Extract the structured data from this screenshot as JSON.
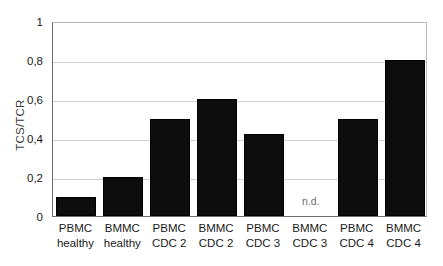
{
  "chart_data": {
    "type": "bar",
    "title": "",
    "subtitle": "",
    "xlabel": "",
    "ylabel": "TCS/TCR",
    "ylim": [
      0,
      1
    ],
    "ytick_labels": [
      "1",
      "0,8",
      "0,6",
      "0,4",
      "0,2",
      "0"
    ],
    "ytick_values": [
      1,
      0.8,
      0.6,
      0.4,
      0.2,
      0
    ],
    "grid": true,
    "legend": false,
    "legend_position": "none",
    "categories": [
      "PBMC healthy",
      "BMMC healthy",
      "PBMC CDC 2",
      "BMMC CDC 2",
      "PBMC CDC 3",
      "BMMC CDC 3",
      "PBMC CDC 4",
      "BMMC CDC 4"
    ],
    "category_lines": [
      {
        "line1": "PBMC",
        "line2": "healthy"
      },
      {
        "line1": "BMMC",
        "line2": "healthy"
      },
      {
        "line1": "PBMC",
        "line2": "CDC 2"
      },
      {
        "line1": "BMMC",
        "line2": "CDC 2"
      },
      {
        "line1": "PBMC",
        "line2": "CDC 3"
      },
      {
        "line1": "BMMC",
        "line2": "CDC 3"
      },
      {
        "line1": "PBMC",
        "line2": "CDC 4"
      },
      {
        "line1": "BMMC",
        "line2": "CDC 4"
      }
    ],
    "values": [
      0.1,
      0.2,
      0.5,
      0.6,
      0.42,
      null,
      0.5,
      0.8
    ],
    "annotations": [
      {
        "category": "BMMC CDC 3",
        "text": "n.d.",
        "value_y": 0.12
      }
    ],
    "bar_color": "#0d0d0d",
    "grid_color": "#d2d2d2",
    "axis_color": "#6e6e6e",
    "annotation_color": "#6b6b6b",
    "background_color": "#ffffff"
  }
}
